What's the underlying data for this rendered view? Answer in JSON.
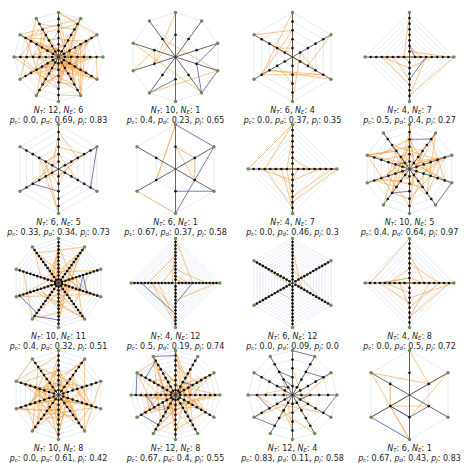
{
  "figure": {
    "colors": {
      "random_edge": "#f5a040",
      "polygon_edge": "#c8d4e8",
      "spoke_cross_edge": "#4a4a9a",
      "outer_node": "#6f8c5a",
      "inner_node": "#111111"
    },
    "label_symbols": {
      "nt": "N",
      "nt_sub": "T",
      "ne": "N",
      "ne_sub": "E",
      "pc": "p",
      "pc_sub": "c",
      "pd": "p",
      "pd_sub": "d",
      "pj": "p",
      "pj_sub": "j"
    },
    "panels": [
      {
        "nt": 12,
        "ne": 6,
        "pc": "0.0",
        "pd": "0.69",
        "pj": "0.83"
      },
      {
        "nt": 10,
        "ne": 1,
        "pc": "0.4",
        "pd": "0.23",
        "pj": "0.65"
      },
      {
        "nt": 6,
        "ne": 4,
        "pc": "0.0",
        "pd": "0.37",
        "pj": "0.35"
      },
      {
        "nt": 4,
        "ne": 7,
        "pc": "0.5",
        "pd": "0.4",
        "pj": "0.27"
      },
      {
        "nt": 6,
        "ne": 5,
        "pc": "0.33",
        "pd": "0.34",
        "pj": "0.73"
      },
      {
        "nt": 6,
        "ne": 1,
        "pc": "0.67",
        "pd": "0.37",
        "pj": "0.58"
      },
      {
        "nt": 4,
        "ne": 7,
        "pc": "0.0",
        "pd": "0.46",
        "pj": "0.3"
      },
      {
        "nt": 10,
        "ne": 5,
        "pc": "0.4",
        "pd": "0.64",
        "pj": "0.97"
      },
      {
        "nt": 10,
        "ne": 11,
        "pc": "0.4",
        "pd": "0.32",
        "pj": "0.51"
      },
      {
        "nt": 4,
        "ne": 12,
        "pc": "0.5",
        "pd": "0.19",
        "pj": "0.74"
      },
      {
        "nt": 6,
        "ne": 12,
        "pc": "0.0",
        "pd": "0.09",
        "pj": "0.0"
      },
      {
        "nt": 4,
        "ne": 8,
        "pc": "0.0",
        "pd": "0.5",
        "pj": "0.72"
      },
      {
        "nt": 10,
        "ne": 8,
        "pc": "0.0",
        "pd": "0.61",
        "pj": "0.42"
      },
      {
        "nt": 12,
        "ne": 8,
        "pc": "0.67",
        "pd": "0.4",
        "pj": "0.55"
      },
      {
        "nt": 12,
        "ne": 4,
        "pc": "0.83",
        "pd": "0.11",
        "pj": "0.58"
      },
      {
        "nt": 6,
        "ne": 1,
        "pc": "0.67",
        "pd": "0.43",
        "pj": "0.83"
      }
    ]
  }
}
